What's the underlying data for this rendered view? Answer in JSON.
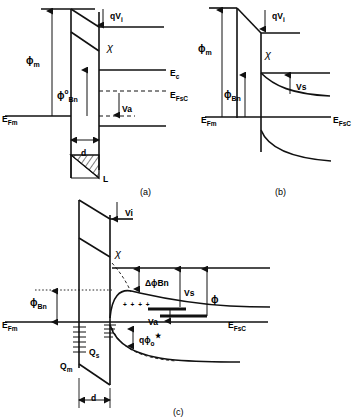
{
  "figure": {
    "panels": [
      {
        "id": "a",
        "caption": "(a)",
        "description": "Ideal metal-semiconductor contact with interfacial layer under applied bias Va",
        "labels": {
          "phi_m": "ϕ",
          "phi_m_sub": "m",
          "phi_bn": "ϕ",
          "phi_bn_sup": "o",
          "phi_bn_sub": "Bn",
          "chi": "χ",
          "qvi": "qV",
          "qvi_sub": "i",
          "ec": "E",
          "ec_sub": "c",
          "efm": "E",
          "efm_sub": "Fm",
          "efsc": "E",
          "efsc_sub": "FsC",
          "va": "Va",
          "d": "d",
          "L": "L"
        }
      },
      {
        "id": "b",
        "caption": "(b)",
        "description": "Zero-bias equilibrium band diagram showing surface potential Vs",
        "labels": {
          "phi_m": "ϕ",
          "phi_m_sub": "m",
          "phi_bn": "ϕ",
          "phi_bn_sub": "Bn",
          "chi": "χ",
          "qvi": "qV",
          "qvi_sub": "i",
          "efm": "E",
          "efm_sub": "Fm",
          "efsc": "E",
          "efsc_sub": "FsC",
          "vs": "Vs"
        }
      },
      {
        "id": "c",
        "caption": "(c)",
        "description": "Band diagram with interface states, image-force barrier lowering and charges Qm, Qs",
        "labels": {
          "phi_bn": "ϕ",
          "phi_bn_sub": "Bn",
          "chi": "χ",
          "vi": "Vi",
          "delta_phi_bn": "ΔϕBn",
          "vs": "Vs",
          "phi": "ϕ",
          "va": "Va",
          "q_phi_o": "qϕ",
          "q_phi_o_sub": "o",
          "q_phi_o_star": "★",
          "efm": "E",
          "efm_sub": "Fm",
          "efsc": "E",
          "efsc_sub": "FsC",
          "qm": "Q",
          "qm_sub": "m",
          "qs": "Q",
          "qs_sub": "s",
          "d": "d",
          "plus_charges": "+ + + +"
        }
      }
    ],
    "colors": {
      "ink": "#111111",
      "background": "#ffffff"
    }
  }
}
